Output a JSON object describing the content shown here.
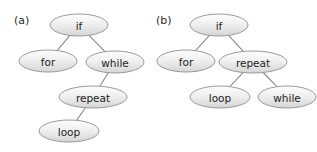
{
  "figure": {
    "background_color": "#ffffff",
    "node_fill_top_color": "#fcfcfc",
    "node_fill_bottom_color": "#d8d8d8",
    "node_stroke_color": "#9a9a9a",
    "edge_color": "#8a8a8a",
    "text_color": "#1c1c1c"
  },
  "panels": [
    {
      "label": "(a)",
      "label_x": 14,
      "label_y": 24,
      "nodes": [
        {
          "id": "a-if",
          "text": "if",
          "cx": 79,
          "cy": 25,
          "rx": 29,
          "ry": 11
        },
        {
          "id": "a-for",
          "text": "for",
          "cx": 48,
          "cy": 61,
          "rx": 29,
          "ry": 11
        },
        {
          "id": "a-while",
          "text": "while",
          "cx": 115,
          "cy": 62,
          "rx": 29,
          "ry": 11
        },
        {
          "id": "a-repeat",
          "text": "repeat",
          "cx": 93,
          "cy": 97,
          "rx": 34,
          "ry": 11
        },
        {
          "id": "a-loop",
          "text": "loop",
          "cx": 69,
          "cy": 131,
          "rx": 30,
          "ry": 11
        }
      ],
      "edges": [
        {
          "from": "a-if",
          "to": "a-for"
        },
        {
          "from": "a-if",
          "to": "a-while"
        },
        {
          "from": "a-while",
          "to": "a-repeat"
        },
        {
          "from": "a-repeat",
          "to": "a-loop"
        }
      ]
    },
    {
      "label": "(b)",
      "label_x": 156,
      "label_y": 24,
      "nodes": [
        {
          "id": "b-if",
          "text": "if",
          "cx": 219,
          "cy": 25,
          "rx": 29,
          "ry": 11
        },
        {
          "id": "b-for",
          "text": "for",
          "cx": 186,
          "cy": 61,
          "rx": 29,
          "ry": 11
        },
        {
          "id": "b-repeat",
          "text": "repeat",
          "cx": 253,
          "cy": 62,
          "rx": 34,
          "ry": 11
        },
        {
          "id": "b-loop",
          "text": "loop",
          "cx": 220,
          "cy": 97,
          "rx": 30,
          "ry": 11
        },
        {
          "id": "b-while",
          "text": "while",
          "cx": 287,
          "cy": 97,
          "rx": 29,
          "ry": 11
        }
      ],
      "edges": [
        {
          "from": "b-if",
          "to": "b-for"
        },
        {
          "from": "b-if",
          "to": "b-repeat"
        },
        {
          "from": "b-repeat",
          "to": "b-loop"
        },
        {
          "from": "b-repeat",
          "to": "b-while"
        }
      ]
    }
  ]
}
